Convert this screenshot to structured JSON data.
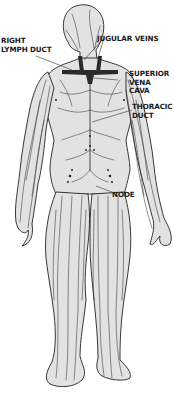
{
  "diagram": {
    "colors": {
      "body_fill": "#e2e2e2",
      "outline": "#222222",
      "vessels": "#333333",
      "veins_dark": "#2a2a2a",
      "label_text": "#1a1a1a",
      "background": "#ffffff"
    },
    "labels": [
      {
        "id": "right-lymph-duct",
        "line1": "RIGHT",
        "line2": "LYMPH DUCT"
      },
      {
        "id": "jugular-veins",
        "line1": "JUGULAR VEINS"
      },
      {
        "id": "superior-vena-cava",
        "line1": "SUPERIOR",
        "line2": "VENA",
        "line3": "CAVA"
      },
      {
        "id": "thoracic-duct",
        "line1": "THORACIC",
        "line2": "DUCT"
      },
      {
        "id": "node",
        "line1": "NODE"
      }
    ]
  }
}
